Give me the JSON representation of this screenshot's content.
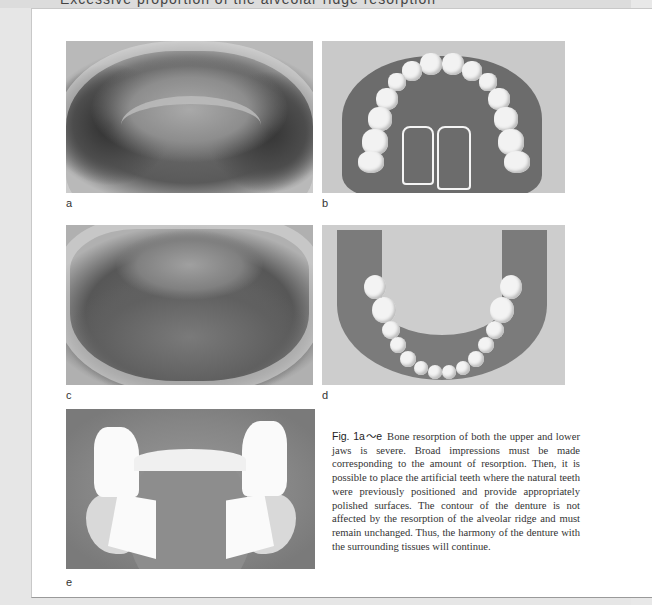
{
  "header": {
    "cut_off_text": "Excessive proportion of the alveolar ridge resorption"
  },
  "figures": [
    {
      "id": "a",
      "label": "a",
      "description": "Upper jaw with severe bone resorption (intraoral view)"
    },
    {
      "id": "b",
      "label": "b",
      "description": "Complete upper denture"
    },
    {
      "id": "c",
      "label": "c",
      "description": "Lower jaw with severe bone resorption (intraoral view)"
    },
    {
      "id": "d",
      "label": "d",
      "description": "Complete lower denture"
    },
    {
      "id": "e",
      "label": "e",
      "description": "Lower denture impression / base"
    }
  ],
  "caption": {
    "fig_label": "Fig. 1a〜e",
    "text": "Bone resorption of both the upper and lower jaws is severe. Broad impressions must be made corresponding to the amount of resorption. Then, it is possible to place the artificial teeth where the natural teeth were previously positioned and provide appropriately polished surfaces. The contour of the denture is not affected by the resorption of the alveolar ridge and must remain unchanged. Thus, the harmony of the denture with the surrounding tissues will continue."
  }
}
